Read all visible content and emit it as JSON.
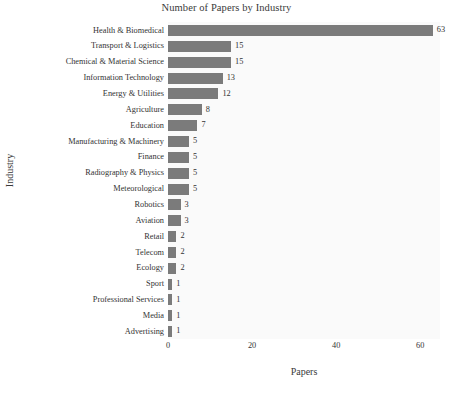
{
  "chart_data": {
    "type": "bar",
    "orientation": "horizontal",
    "title": "Number of Papers by Industry",
    "xlabel": "Papers",
    "ylabel": "Industry",
    "categories": [
      "Health & Biomedical",
      "Transport & Logistics",
      "Chemical & Material Science",
      "Information Technology",
      "Energy & Utilities",
      "Agriculture",
      "Education",
      "Manufacturing & Machinery",
      "Finance",
      "Radiography & Physics",
      "Meteorological",
      "Robotics",
      "Aviation",
      "Retail",
      "Telecom",
      "Ecology",
      "Sport",
      "Professional Services",
      "Media",
      "Advertising"
    ],
    "values": [
      63,
      15,
      15,
      13,
      12,
      8,
      7,
      5,
      5,
      5,
      5,
      3,
      3,
      2,
      2,
      2,
      1,
      1,
      1,
      1
    ],
    "value_labels": [
      "63",
      "15",
      "15",
      "13",
      "12",
      "8",
      "7",
      "5",
      "5",
      "5",
      "5",
      "3",
      "3",
      "2",
      "2",
      "2",
      "1",
      "1",
      "1",
      "1"
    ],
    "xlim": [
      0,
      64.7
    ],
    "xticks": [
      0,
      20,
      40,
      60
    ],
    "xtick_labels": [
      "0",
      "20",
      "40",
      "60"
    ],
    "grid": false,
    "legend": false,
    "bar_color": "#7b7b7b",
    "panel_color": "#fafafa",
    "page_color": "#ffffff",
    "text_color": "#333333"
  }
}
